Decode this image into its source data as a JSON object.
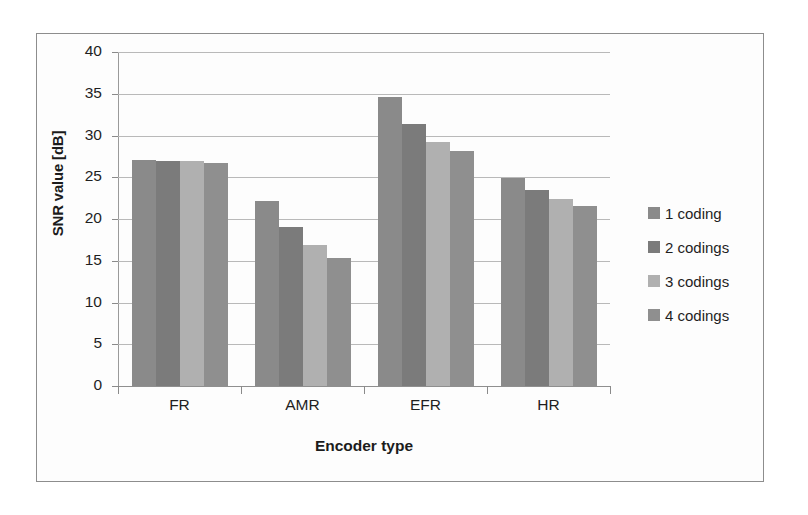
{
  "chart_data": {
    "type": "bar",
    "title": "",
    "xlabel": "Encoder type",
    "ylabel": "SNR value [dB]",
    "categories": [
      "FR",
      "AMR",
      "EFR",
      "HR"
    ],
    "series": [
      {
        "name": "1 coding",
        "values": [
          27.1,
          22.2,
          34.6,
          24.9
        ],
        "color": "#8a8a8a"
      },
      {
        "name": "2 codings",
        "values": [
          27.0,
          19.1,
          31.4,
          23.5
        ],
        "color": "#7b7b7b"
      },
      {
        "name": "3 codings",
        "values": [
          26.9,
          16.9,
          29.2,
          22.4
        ],
        "color": "#b0b0b0"
      },
      {
        "name": "4 codings",
        "values": [
          26.7,
          15.3,
          28.1,
          21.6
        ],
        "color": "#8f8f8f"
      }
    ],
    "ylim": [
      0,
      40
    ],
    "ytick_labels": [
      "40",
      "35",
      "30",
      "25",
      "20",
      "15",
      "10",
      "5",
      "0"
    ],
    "ytick_values": [
      40,
      35,
      30,
      25,
      20,
      15,
      10,
      5,
      0
    ],
    "grid": true,
    "legend_position": "right"
  },
  "axis": {
    "y_title": "SNR value [dB]",
    "x_title": "Encoder type"
  },
  "legend": {
    "items": [
      {
        "label": "1 coding"
      },
      {
        "label": "2 codings"
      },
      {
        "label": "3 codings"
      },
      {
        "label": "4 codings"
      }
    ]
  }
}
